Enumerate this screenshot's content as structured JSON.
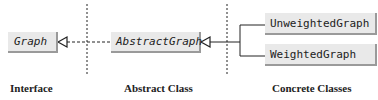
{
  "diagram": {
    "nodes": [
      {
        "id": "graph",
        "label": "Graph",
        "kind": "interface"
      },
      {
        "id": "abstract_graph",
        "label": "AbstractGraph",
        "kind": "abstract"
      },
      {
        "id": "unweighted_graph",
        "label": "UnweightedGraph",
        "kind": "concrete"
      },
      {
        "id": "weighted_graph",
        "label": "WeightedGraph",
        "kind": "concrete"
      }
    ],
    "edges": [
      {
        "from": "AbstractGraph",
        "to": "Graph",
        "type": "implements (dashed, hollow arrow)"
      },
      {
        "from": "UnweightedGraph",
        "to": "AbstractGraph",
        "type": "extends (solid, hollow arrow)"
      },
      {
        "from": "WeightedGraph",
        "to": "AbstractGraph",
        "type": "extends (solid, hollow arrow)"
      }
    ],
    "section_labels": {
      "interface": "Interface",
      "abstract": "Abstract Class",
      "concrete": "Concrete Classes"
    },
    "colors": {
      "box_fill": "#e9e9e9",
      "box_shadow": "#9a9a9a",
      "line": "#222222"
    }
  }
}
